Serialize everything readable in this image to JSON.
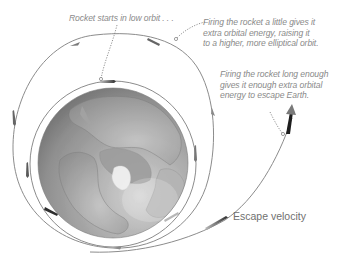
{
  "annotations": {
    "low_orbit": {
      "lines": [
        "Rocket starts in low orbit . . ."
      ]
    },
    "elliptical_orbit": {
      "lines": [
        "Firing the rocket a little gives it",
        "extra orbital energy, raising it",
        "to a higher, more elliptical orbit."
      ]
    },
    "escape": {
      "lines": [
        "Firing the rocket long enough",
        "gives it enough extra orbital",
        "energy to escape Earth."
      ]
    }
  },
  "labels": {
    "escape_velocity": "Escape velocity"
  },
  "elements": {
    "globe": "earth-globe-north-pole-view",
    "orbits": [
      "low-circular-orbit",
      "elliptical-orbit",
      "escape-trajectory"
    ]
  },
  "colors": {
    "orbit_line": "#8c8c8c",
    "globe_dark": "#6e6e6e",
    "globe_light": "#c9c9c9",
    "annotation_text": "#8a8a8a",
    "rocket": "#3a3a3a",
    "escape_arrow": "#1e1e1e"
  }
}
